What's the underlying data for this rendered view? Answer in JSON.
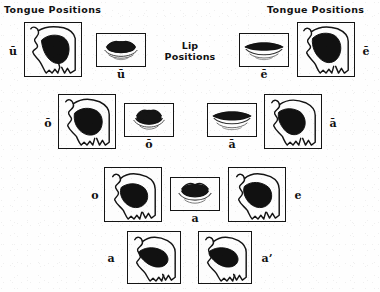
{
  "figure": {
    "type": "diagram",
    "title_left": "Tongue Positions",
    "title_right": "Tongue Positions",
    "title_middle_line1": "Lip",
    "title_middle_line2": "Positions",
    "colors": {
      "ink": "#141414",
      "paper": "#fefefe",
      "tongue_fill": "#111111"
    }
  },
  "rows": [
    {
      "row_index": 1,
      "left_tongue_label": "ū",
      "left_lip_label": "ū",
      "right_lip_label": "ē",
      "right_tongue_label": "ē"
    },
    {
      "row_index": 2,
      "left_tongue_label": "ō",
      "left_lip_label": "ō",
      "right_lip_label": "ā",
      "right_tongue_label": "ā"
    },
    {
      "row_index": 3,
      "left_tongue_label": "o",
      "center_lip_label": "a",
      "right_tongue_label": "e"
    },
    {
      "row_index": 4,
      "left_tongue_label": "a",
      "right_tongue_label": "a’"
    }
  ],
  "tongue_panels": [
    {
      "id": "tongue-u-macron",
      "label": "ū",
      "label_side": "left"
    },
    {
      "id": "tongue-e-macron",
      "label": "ē",
      "label_side": "right"
    },
    {
      "id": "tongue-o-macron",
      "label": "ō",
      "label_side": "left"
    },
    {
      "id": "tongue-a-macron",
      "label": "ā",
      "label_side": "right"
    },
    {
      "id": "tongue-o",
      "label": "o",
      "label_side": "left"
    },
    {
      "id": "tongue-e",
      "label": "e",
      "label_side": "right"
    },
    {
      "id": "tongue-a",
      "label": "a",
      "label_side": "left"
    },
    {
      "id": "tongue-a-prime",
      "label": "a’",
      "label_side": "right"
    }
  ],
  "lip_panels": [
    {
      "id": "lips-u-macron",
      "label": "ū"
    },
    {
      "id": "lips-e-macron",
      "label": "ē"
    },
    {
      "id": "lips-o-macron",
      "label": "ō"
    },
    {
      "id": "lips-a-macron",
      "label": "ā"
    },
    {
      "id": "lips-a",
      "label": "a"
    }
  ]
}
